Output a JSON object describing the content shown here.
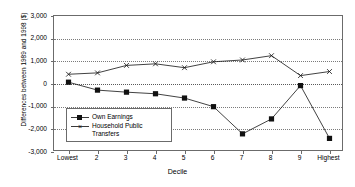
{
  "chart_data": {
    "type": "line",
    "title": "",
    "xlabel": "Decile",
    "ylabel": "Differences between 1989 and 1998 ($)",
    "categories": [
      "Lowest",
      "2",
      "3",
      "4",
      "5",
      "6",
      "7",
      "8",
      "9",
      "Highest"
    ],
    "yticks": [
      "3,000",
      "2,000",
      "1,000",
      "0",
      "-1,000",
      "-2,000",
      "-3,000"
    ],
    "ytick_values": [
      3000,
      2000,
      1000,
      0,
      -1000,
      -2000,
      -3000
    ],
    "ylim": [
      -3000,
      3000
    ],
    "grid": true,
    "legend_position": "inside-lower-left",
    "series": [
      {
        "name": "Own Earnings",
        "marker": "filled-square",
        "color": "#111111",
        "values": [
          80,
          -270,
          -360,
          -430,
          -620,
          -1000,
          -2200,
          -1540,
          -70,
          -2400
        ]
      },
      {
        "name": "Household Public Transfers",
        "marker": "x",
        "color": "#111111",
        "values": [
          430,
          490,
          820,
          890,
          720,
          980,
          1060,
          1250,
          370,
          550
        ]
      }
    ]
  }
}
